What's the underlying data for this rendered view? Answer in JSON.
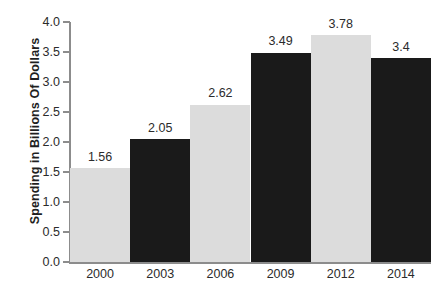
{
  "chart_data": {
    "type": "bar",
    "title": "",
    "subtitle": "",
    "xlabel": "",
    "ylabel": "Spending in Billions Of Dollars",
    "categories": [
      "2000",
      "2003",
      "2006",
      "2009",
      "2012",
      "2014"
    ],
    "values": [
      1.56,
      2.05,
      2.62,
      3.49,
      3.78,
      3.4
    ],
    "value_labels": [
      "1.56",
      "2.05",
      "2.62",
      "3.49",
      "3.78",
      "3.4"
    ],
    "bar_colors": [
      "#dcdcdc",
      "#1a1a1a",
      "#dcdcdc",
      "#1a1a1a",
      "#dcdcdc",
      "#1a1a1a"
    ],
    "ylim": [
      0.0,
      4.0
    ],
    "ytick_labels": [
      "0.0",
      "0.5",
      "1.0",
      "1.5",
      "2.0",
      "2.5",
      "3.0",
      "3.5",
      "4.0"
    ],
    "ytick_values": [
      0.0,
      0.5,
      1.0,
      1.5,
      2.0,
      2.5,
      3.0,
      3.5,
      4.0
    ],
    "grid": false,
    "legend": null,
    "legend_position": "none",
    "bar_gap": 0,
    "background_color": "#ffffff",
    "axis_color": "#8c8c8c",
    "text_color": "#2b2b2b"
  }
}
